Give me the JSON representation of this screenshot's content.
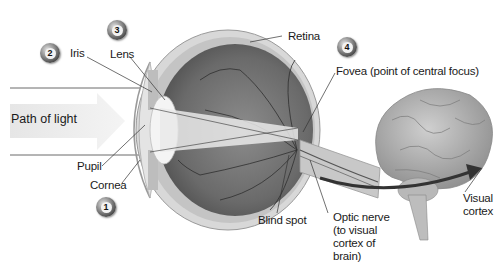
{
  "diagram": {
    "path_label": "Path of light",
    "badges": [
      {
        "number": "1",
        "target": "Cornea"
      },
      {
        "number": "2",
        "target": "Iris"
      },
      {
        "number": "3",
        "target": "Lens"
      },
      {
        "number": "4",
        "target": "Fovea"
      }
    ],
    "labels": {
      "iris": "Iris",
      "lens": "Lens",
      "retina": "Retina",
      "fovea": "Fovea (point of central focus)",
      "pupil": "Pupil",
      "cornea": "Cornea",
      "blind_spot": "Blind spot",
      "optic_nerve": "Optic nerve (to visual cortex of brain)",
      "optic_nerve_lines": [
        "Optic nerve",
        "(to visual",
        "cortex of",
        "brain)"
      ],
      "visual_cortex": "Visual cortex",
      "visual_cortex_lines": [
        "Visual",
        "cortex"
      ]
    },
    "colors": {
      "eyeball_interior": "#6e6e6e",
      "sclera": "#d4d4d4",
      "light_beam": "#ececec",
      "brain": "#b0b0b0",
      "badge": "#4a4a4a",
      "leader_line": "#333333"
    }
  }
}
